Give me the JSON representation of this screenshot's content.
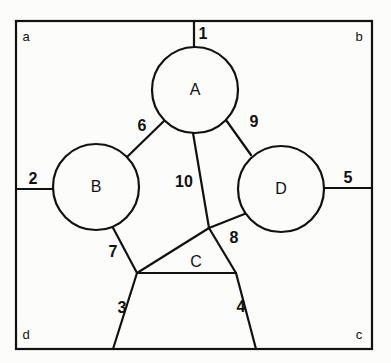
{
  "figure": {
    "canvas": {
      "width": 391,
      "height": 363
    },
    "background_color": "#fcfcfa",
    "stroke_color": "#111111"
  },
  "border": {
    "name": "outer-rectangle",
    "x1": 16,
    "y1": 21,
    "x2": 372,
    "y2": 349
  },
  "corner_labels": [
    {
      "id": "a",
      "text": "a",
      "x": 26,
      "y": 36
    },
    {
      "id": "b",
      "text": "b",
      "x": 359,
      "y": 36
    },
    {
      "id": "d",
      "text": "d",
      "x": 26,
      "y": 334
    },
    {
      "id": "c",
      "text": "c",
      "x": 359,
      "y": 334
    }
  ],
  "nodes": [
    {
      "id": "A",
      "label": "A",
      "cx": 195,
      "cy": 90,
      "r": 43
    },
    {
      "id": "B",
      "label": "B",
      "cx": 96,
      "cy": 187,
      "r": 43
    },
    {
      "id": "D",
      "label": "D",
      "cx": 281,
      "cy": 189,
      "r": 43
    },
    {
      "id": "C",
      "label": "C",
      "shape": "triangle",
      "points": "209,228 137,273 236,273",
      "label_x": 196,
      "label_y": 262
    }
  ],
  "edges": [
    {
      "id": "1",
      "label": "1",
      "from": "border-top",
      "to": "A",
      "path": "M 194 21 L 194 47",
      "label_x": 203,
      "label_y": 34
    },
    {
      "id": "2",
      "label": "2",
      "from": "border-left",
      "to": "B",
      "path": "M 16 189 L 53 189",
      "label_x": 33,
      "label_y": 179
    },
    {
      "id": "5",
      "label": "5",
      "from": "D",
      "to": "border-right",
      "path": "M 324 188 L 372 188",
      "label_x": 348,
      "label_y": 178
    },
    {
      "id": "6",
      "label": "6",
      "from": "B",
      "to": "A",
      "path": "M 127 157 L 164 121",
      "label_x": 142,
      "label_y": 126
    },
    {
      "id": "9",
      "label": "9",
      "from": "A",
      "to": "D",
      "path": "M 226 120 L 251 155",
      "label_x": 254,
      "label_y": 122
    },
    {
      "id": "10",
      "label": "10",
      "from": "A",
      "to": "C",
      "path": "M 193 133 L 209 228",
      "label_x": 184,
      "label_y": 182
    },
    {
      "id": "7",
      "label": "7",
      "from": "B",
      "to": "C",
      "path": "M 111 224 L 137 273",
      "label_x": 113,
      "label_y": 252
    },
    {
      "id": "8",
      "label": "8",
      "from": "C",
      "to": "D",
      "path": "M 209 228 L 247 213",
      "label_x": 234,
      "label_y": 238
    },
    {
      "id": "3",
      "label": "3",
      "from": "C",
      "to": "border-bottom",
      "path": "M 137 273 L 113 349",
      "label_x": 122,
      "label_y": 308
    },
    {
      "id": "4",
      "label": "4",
      "from": "C",
      "to": "border-bottom",
      "path": "M 236 273 L 256 349",
      "label_x": 241,
      "label_y": 307
    }
  ]
}
